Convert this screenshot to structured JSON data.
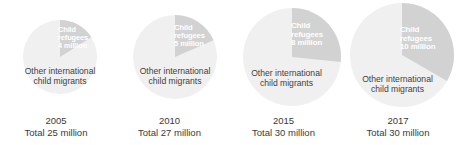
{
  "chart_data": {
    "type": "pie",
    "title": "",
    "subtitle": "",
    "xlabel": "",
    "ylabel": "",
    "legend_position": "in-slice",
    "grid": false,
    "units": "million",
    "series_names": [
      "Child refugees",
      "Other international child migrants"
    ],
    "colors": {
      "child_refugees": "#d2d2d2",
      "other_migrants": "#f0f0f0",
      "wedge_label_text": "#ffffff",
      "other_label_text": "#3f3f3f",
      "caption_text": "#3a3a3a",
      "background": "#ffffff"
    },
    "panels": [
      {
        "year": "2005",
        "total_label": "Total 25 million",
        "total_value": 25,
        "refugees_label": "Child\nrefugees\n4 million",
        "refugees_value": 4,
        "other_label": "Other international\nchild migrants",
        "other_value": 21,
        "refugees_share_pct": 16,
        "radius_px": 37
      },
      {
        "year": "2010",
        "total_label": "Total 27 million",
        "total_value": 27,
        "refugees_label": "Child\nrefugees\n5 million",
        "refugees_value": 5,
        "other_label": "Other international\nchild migrants",
        "other_value": 22,
        "refugees_share_pct": 18.5,
        "radius_px": 42
      },
      {
        "year": "2015",
        "total_label": "Total 30 million",
        "total_value": 30,
        "refugees_label": "Child\nrefugees\n8 million",
        "refugees_value": 8,
        "other_label": "Other international\nchild migrants",
        "other_value": 22,
        "refugees_share_pct": 26.7,
        "radius_px": 49
      },
      {
        "year": "2017",
        "total_label": "Total 30 million",
        "total_value": 30,
        "refugees_label": "Child\nrefugees\n10 million",
        "refugees_value": 10,
        "other_label": "Other international\nchild migrants",
        "other_value": 20,
        "refugees_share_pct": 33.3,
        "radius_px": 52
      }
    ]
  }
}
